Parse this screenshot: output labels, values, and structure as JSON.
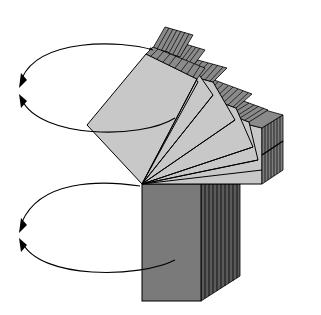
{
  "diagram": {
    "pivot": [
      142,
      184
    ],
    "colors": {
      "background": "#ffffff",
      "stroke": "#000000",
      "fan_face": "#c8c8c8",
      "fan_edge": "#8a8a8a",
      "block_face": "#7a7a7a",
      "block_edge": "#505050"
    },
    "fan": {
      "panel_count": 8,
      "angles_deg": [
        -62,
        -54,
        -46,
        -38,
        -30,
        -22,
        -12,
        0
      ],
      "panel_length": 120,
      "panel_width": 60,
      "edge_depth": 16
    },
    "block": {
      "front": [
        [
          142,
          184
        ],
        [
          201,
          184
        ],
        [
          201,
          301
        ],
        [
          142,
          301
        ]
      ],
      "edge_count": 10,
      "edge_dx": 4,
      "edge_dy": -3
    },
    "arrows": [
      {
        "name": "upper-rotation-arrow",
        "cx": 95,
        "cy": 88,
        "rx": 75,
        "ry": 45
      },
      {
        "name": "lower-rotation-arrow",
        "cx": 95,
        "cy": 232,
        "rx": 75,
        "ry": 40
      }
    ]
  }
}
